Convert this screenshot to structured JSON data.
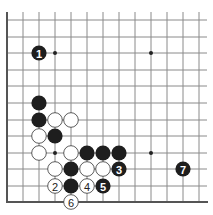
{
  "diagram": {
    "type": "go-board-diagram",
    "grid": {
      "columns_x": [
        7,
        23,
        39,
        55,
        71,
        87,
        103,
        119,
        135,
        151,
        167,
        183,
        199
      ],
      "rows_y": [
        20,
        37,
        53,
        70,
        86,
        103,
        120,
        136,
        153,
        169,
        186,
        202
      ],
      "top_extend_y": 12,
      "right_extend_x": 207,
      "edges": [
        "left",
        "bottom"
      ]
    },
    "colors": {
      "line": "#8a8a8a",
      "edge": "#555555",
      "black_stone": "#1e1e1e",
      "white_stone": "#ffffff",
      "white_outline": "#333333"
    },
    "star_points": [
      {
        "x": 55,
        "y": 53
      },
      {
        "x": 151,
        "y": 53
      },
      {
        "x": 55,
        "y": 153
      },
      {
        "x": 151,
        "y": 153
      }
    ],
    "stones": [
      {
        "x": 39,
        "y": 53,
        "color": "black",
        "label": "1"
      },
      {
        "x": 39,
        "y": 103,
        "color": "black",
        "label": ""
      },
      {
        "x": 39,
        "y": 120,
        "color": "black",
        "label": ""
      },
      {
        "x": 55,
        "y": 120,
        "color": "white",
        "label": ""
      },
      {
        "x": 71,
        "y": 120,
        "color": "white",
        "label": ""
      },
      {
        "x": 39,
        "y": 136,
        "color": "white",
        "label": ""
      },
      {
        "x": 55,
        "y": 136,
        "color": "black",
        "label": ""
      },
      {
        "x": 39,
        "y": 153,
        "color": "white",
        "label": ""
      },
      {
        "x": 71,
        "y": 153,
        "color": "white",
        "label": ""
      },
      {
        "x": 87,
        "y": 153,
        "color": "black",
        "label": ""
      },
      {
        "x": 103,
        "y": 153,
        "color": "black",
        "label": ""
      },
      {
        "x": 119,
        "y": 153,
        "color": "black",
        "label": ""
      },
      {
        "x": 55,
        "y": 169,
        "color": "white",
        "label": ""
      },
      {
        "x": 71,
        "y": 169,
        "color": "black",
        "label": ""
      },
      {
        "x": 87,
        "y": 169,
        "color": "white",
        "label": ""
      },
      {
        "x": 103,
        "y": 169,
        "color": "white",
        "label": ""
      },
      {
        "x": 119,
        "y": 169,
        "color": "black",
        "label": "3"
      },
      {
        "x": 55,
        "y": 186,
        "color": "white",
        "label": "2"
      },
      {
        "x": 71,
        "y": 186,
        "color": "black",
        "label": ""
      },
      {
        "x": 87,
        "y": 186,
        "color": "white",
        "label": "4"
      },
      {
        "x": 103,
        "y": 186,
        "color": "black",
        "label": "5"
      },
      {
        "x": 71,
        "y": 202,
        "color": "white",
        "label": "6"
      },
      {
        "x": 183,
        "y": 169,
        "color": "black",
        "label": "7"
      }
    ]
  }
}
